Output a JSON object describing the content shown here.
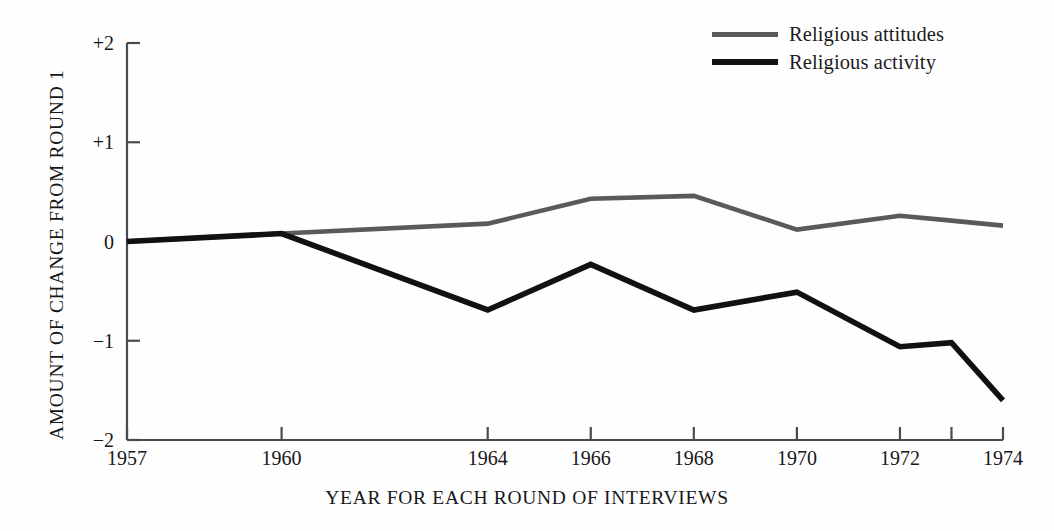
{
  "chart_data": {
    "type": "line",
    "title": "",
    "xlabel": "YEAR FOR EACH ROUND OF INTERVIEWS",
    "ylabel": "AMOUNT OF CHANGE FROM ROUND 1",
    "xlim": [
      1957,
      1974
    ],
    "ylim": [
      -2,
      2
    ],
    "grid": false,
    "legend_position": "top-right",
    "x_tick_labels": [
      "1957",
      "1960",
      "1964",
      "1966",
      "1968",
      "1970",
      "1972",
      "1974"
    ],
    "x_ticks": [
      1957,
      1960,
      1964,
      1966,
      1968,
      1970,
      1972,
      1974
    ],
    "x_minor_ticks": [
      1973
    ],
    "y_tick_labels": [
      "+2",
      "+1",
      "0",
      "−1",
      "−2"
    ],
    "y_ticks": [
      2,
      1,
      0,
      -1,
      -2
    ],
    "x": [
      1957,
      1960,
      1964,
      1966,
      1968,
      1970,
      1972,
      1973,
      1974
    ],
    "series": [
      {
        "name": "Religious attitudes",
        "color": "#5a5a5a",
        "values": [
          0.0,
          0.08,
          0.18,
          0.43,
          0.46,
          0.12,
          0.26,
          0.21,
          0.16
        ]
      },
      {
        "name": "Religious activity",
        "color": "#111111",
        "values": [
          0.0,
          0.08,
          -0.69,
          -0.23,
          -0.69,
          -0.51,
          -1.06,
          -1.02,
          -1.6
        ]
      }
    ]
  },
  "legend": {
    "items": [
      {
        "label": "Religious attitudes",
        "color": "#5a5a5a"
      },
      {
        "label": "Religious activity",
        "color": "#111111"
      }
    ]
  },
  "axes": {
    "x_title": "YEAR FOR EACH ROUND OF INTERVIEWS",
    "y_title": "AMOUNT OF CHANGE FROM ROUND 1",
    "y_labels": [
      "+2",
      "+1",
      "0",
      "−1",
      "−2"
    ],
    "x_labels": [
      "1957",
      "1960",
      "1964",
      "1966",
      "1968",
      "1970",
      "1972",
      "1974"
    ]
  }
}
